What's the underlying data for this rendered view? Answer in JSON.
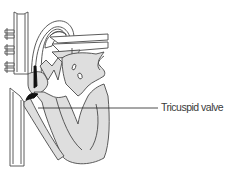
{
  "diagram": {
    "labels": [
      {
        "text": "Tricuspid valve",
        "target": "tricuspid-valve"
      }
    ]
  },
  "colors": {
    "fill": "#dedede",
    "stroke": "#4a4a4a",
    "valve": "#111111",
    "background": "#ffffff"
  }
}
